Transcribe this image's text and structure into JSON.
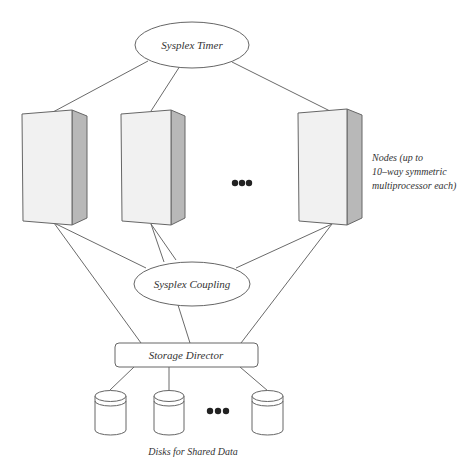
{
  "diagram": {
    "timer": {
      "label": "Sysplex Timer"
    },
    "coupling": {
      "label": "Sysplex Coupling"
    },
    "storage_director": {
      "label": "Storage Director"
    },
    "nodes": {
      "count_shown": 3,
      "ellipsis": "•••",
      "label_lines": [
        "Nodes (up to",
        "10–way symmetric",
        "multiprocessor each)"
      ]
    },
    "disks": {
      "count_shown": 3,
      "ellipsis": "•••",
      "label": "Disks for Shared Data"
    },
    "colors": {
      "line": "#666666",
      "node_front": "#f2f2f2",
      "node_side": "#b5b5b5",
      "text": "#333333",
      "dots": "#222222"
    }
  }
}
